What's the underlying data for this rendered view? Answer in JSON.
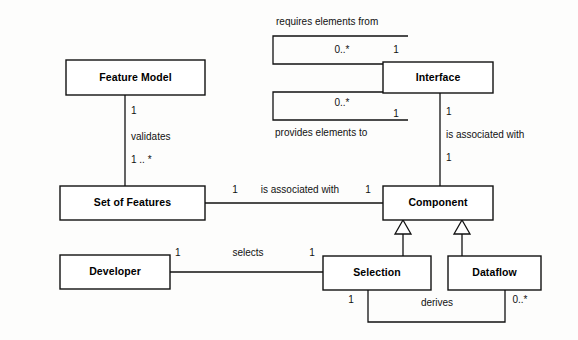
{
  "diagram": {
    "type": "uml-class-diagram",
    "title": "",
    "background_color": "#fdfdfc",
    "line_color": "#111111",
    "box_fill": "#ffffff",
    "classes": [
      {
        "id": "feature-model",
        "label": "Feature Model",
        "x": 66,
        "y": 60,
        "w": 139,
        "h": 35
      },
      {
        "id": "set-of-features",
        "label": "Set of Features",
        "x": 60,
        "y": 186,
        "w": 145,
        "h": 34
      },
      {
        "id": "developer",
        "label": "Developer",
        "x": 60,
        "y": 255,
        "w": 110,
        "h": 34
      },
      {
        "id": "interface",
        "label": "Interface",
        "x": 383,
        "y": 62,
        "w": 110,
        "h": 31
      },
      {
        "id": "component",
        "label": "Component",
        "x": 383,
        "y": 186,
        "w": 110,
        "h": 34
      },
      {
        "id": "selection",
        "label": "Selection",
        "x": 323,
        "y": 256,
        "w": 108,
        "h": 34
      },
      {
        "id": "dataflow",
        "label": "Dataflow",
        "x": 448,
        "y": 256,
        "w": 93,
        "h": 34
      }
    ],
    "associations": [
      {
        "id": "validates",
        "label": "validates",
        "from": "feature-model",
        "to": "set-of-features",
        "source_multiplicity": "1",
        "target_multiplicity": "1 .. *"
      },
      {
        "id": "features-component",
        "label": "is associated with",
        "from": "set-of-features",
        "to": "component",
        "source_multiplicity": "1",
        "target_multiplicity": "1"
      },
      {
        "id": "interface-component",
        "label": "is associated with",
        "from": "interface",
        "to": "component",
        "source_multiplicity": "1",
        "target_multiplicity": "1"
      },
      {
        "id": "requires-elements",
        "label": "requires elements from",
        "from": "interface",
        "to": "interface",
        "source_multiplicity": "0..*",
        "target_multiplicity": "1"
      },
      {
        "id": "provides-elements",
        "label": "provides elements to",
        "from": "interface",
        "to": "interface",
        "source_multiplicity": "0..*",
        "target_multiplicity": "1"
      },
      {
        "id": "selects",
        "label": "selects",
        "from": "developer",
        "to": "selection",
        "source_multiplicity": "1",
        "target_multiplicity": "1"
      },
      {
        "id": "derives",
        "label": "derives",
        "from": "selection",
        "to": "dataflow",
        "source_multiplicity": "1",
        "target_multiplicity": "0..*"
      }
    ],
    "generalizations": [
      {
        "id": "selection-component",
        "from": "selection",
        "to": "component"
      },
      {
        "id": "dataflow-component",
        "from": "dataflow",
        "to": "component"
      }
    ],
    "labels": {
      "requires_elements_from": "requires elements from",
      "provides_elements_to": "provides elements to",
      "validates": "validates",
      "is_associated_with_mid": "is associated with",
      "is_associated_with_right": "is associated with",
      "selects": "selects",
      "derives": "derives"
    },
    "multiplicities": {
      "fm_one": "1",
      "sof_one_star": "1 .. *",
      "req_zero_star": "0..*",
      "req_one": "1",
      "prov_zero_star": "0..*",
      "prov_one": "1",
      "iface_one": "1",
      "comp_one": "1",
      "sof_assoc_one": "1",
      "comp_assoc_one": "1",
      "dev_one": "1",
      "sel_one": "1",
      "sel_derives_one": "1",
      "df_zero_star": "0..*"
    }
  }
}
